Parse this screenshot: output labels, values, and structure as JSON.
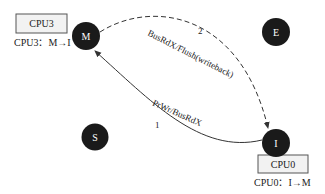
{
  "diagram": {
    "nodes": [
      {
        "id": "M",
        "label": "M"
      },
      {
        "id": "E",
        "label": "E"
      },
      {
        "id": "S",
        "label": "S"
      },
      {
        "id": "I",
        "label": "I"
      }
    ],
    "boxes": [
      {
        "label": "CPU3",
        "caption": "CPU3：M→I"
      },
      {
        "label": "CPU0",
        "caption": "CPU0：I→M"
      }
    ],
    "edges": [
      {
        "from": "I",
        "to": "M",
        "label": "PrWr/BusRdX",
        "step": "1",
        "style": "solid"
      },
      {
        "from": "M",
        "to": "I",
        "label": "BusRdX/Flush(writeback)",
        "step": "2",
        "style": "dashed"
      }
    ],
    "colors": {
      "node_fill": "#1a1a1a",
      "box_fill": "#f2f2f2",
      "box_stroke": "#555555",
      "line": "#333333"
    }
  }
}
